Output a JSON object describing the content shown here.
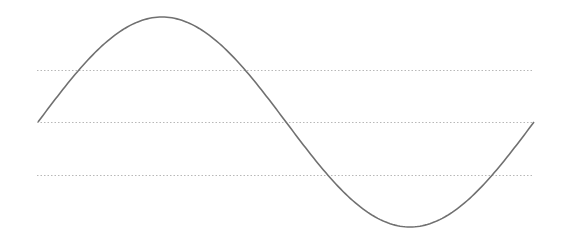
{
  "chart_data": {
    "type": "line",
    "title": "",
    "xlabel": "",
    "ylabel": "",
    "function": "sin",
    "x_range_radians": [
      0,
      6.2832
    ],
    "ylim": [
      -1.05,
      1.05
    ],
    "gridlines_y": [
      -0.5,
      0,
      0.5
    ],
    "grid": "horizontal-dotted",
    "legend": "none",
    "series": [
      {
        "name": "sine",
        "color": "#707070",
        "x": [
          0,
          0.5236,
          1.0472,
          1.5708,
          2.0944,
          2.618,
          3.1416,
          3.6652,
          4.1888,
          4.7124,
          5.236,
          5.7596,
          6.2832
        ],
        "values": [
          0,
          0.5,
          0.866,
          1,
          0.866,
          0.5,
          0,
          -0.5,
          -0.866,
          -1,
          -0.866,
          -0.5,
          0
        ]
      }
    ],
    "colors": {
      "grid": "#b8b8b8",
      "line": "#707070",
      "background": "#ffffff"
    }
  }
}
